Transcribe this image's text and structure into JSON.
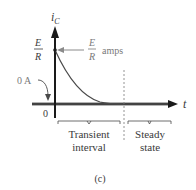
{
  "figure": {
    "caption": "(c)",
    "y_axis_label_main": "i",
    "y_axis_label_sub": "C",
    "x_axis_label": "t",
    "origin_label": "0",
    "zero_annotation": "0 A",
    "initial_value": {
      "numerator": "E",
      "denominator": "R"
    },
    "initial_value_annotation": {
      "numerator": "E",
      "denominator": "R",
      "unit": "amps"
    },
    "regions": [
      {
        "line1": "Transient",
        "line2": "interval"
      },
      {
        "line1": "Steady",
        "line2": "state"
      }
    ],
    "colors": {
      "axis": "#1a1a1a",
      "curve": "#4a4a4a",
      "annotation_gray": "#8a8a8a",
      "text": "#3a3a3a"
    }
  }
}
